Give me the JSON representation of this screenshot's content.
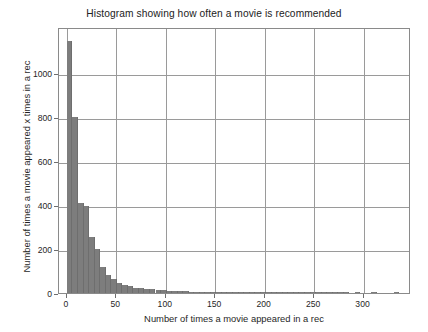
{
  "chart_data": {
    "type": "bar",
    "title": "Histogram showing how often a movie is recommended",
    "xlabel": "Number of times a movie appeared in a rec",
    "ylabel": "Number of times a movie appeared x times in a rec",
    "xlim": [
      -8,
      348
    ],
    "ylim": [
      0,
      1210
    ],
    "xticks": [
      0,
      50,
      100,
      150,
      200,
      250,
      300
    ],
    "xticklabels": [
      "0",
      "50",
      "100",
      "150",
      "200",
      "250",
      "300"
    ],
    "yticks": [
      0,
      200,
      400,
      600,
      800,
      1000
    ],
    "yticklabels": [
      "0",
      "200",
      "400",
      "600",
      "800",
      "1000"
    ],
    "grid": true,
    "grid_axis": "both",
    "bar_color": "#7d7d7d",
    "bin_width": 5.6,
    "bin_starts": [
      0,
      5.6,
      11.2,
      16.8,
      22.4,
      28,
      33.6,
      39.2,
      44.8,
      50.4,
      56,
      61.6,
      67.2,
      72.8,
      78.4,
      84,
      89.6,
      95.2,
      100.8,
      106.4,
      112,
      117.6,
      123.2,
      128.8,
      134.4,
      140,
      145.6,
      151.2,
      156.8,
      162.4,
      168,
      173.6,
      179.2,
      184.8,
      190.4,
      196,
      201.6,
      207.2,
      212.8,
      218.4,
      224,
      229.6,
      235.2,
      240.8,
      246.4,
      252,
      257.6,
      263.2,
      268.8,
      274.4,
      280,
      285.6,
      291.2,
      296.8,
      302.4,
      308,
      313.6,
      319.2,
      324.8,
      330.4
    ],
    "values": [
      1145,
      800,
      410,
      395,
      255,
      200,
      120,
      80,
      62,
      45,
      38,
      30,
      25,
      22,
      18,
      16,
      14,
      12,
      10,
      9,
      8,
      7,
      6,
      6,
      5,
      5,
      4,
      4,
      3,
      3,
      3,
      2,
      2,
      2,
      2,
      2,
      2,
      1,
      1,
      1,
      1,
      1,
      1,
      1,
      1,
      1,
      1,
      1,
      1,
      1,
      1,
      0,
      1,
      0,
      0,
      1,
      0,
      0,
      0,
      1
    ]
  }
}
